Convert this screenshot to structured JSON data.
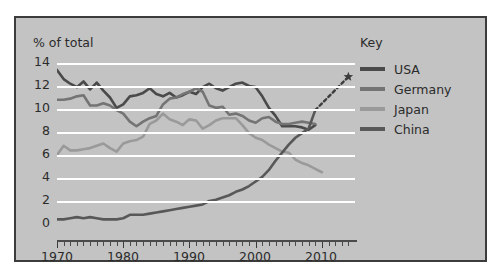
{
  "axis_title": "% of total",
  "legend": {
    "title": "Key",
    "items": [
      {
        "label": "USA",
        "color": "#4a4a4a"
      },
      {
        "label": "Germany",
        "color": "#747474"
      },
      {
        "label": "Japan",
        "color": "#9a9a9a"
      },
      {
        "label": "China",
        "color": "#585858"
      }
    ]
  },
  "yticks": [
    "14",
    "12",
    "10",
    "8",
    "6",
    "4",
    "2",
    "0"
  ],
  "xticks": [
    "1970",
    "1980",
    "1990",
    "2000",
    "2010"
  ],
  "chart_data": {
    "type": "line",
    "title": "",
    "xlabel": "",
    "ylabel": "% of total",
    "xlim": [
      1970,
      2015
    ],
    "ylim": [
      0,
      14
    ],
    "yticks": [
      0,
      2,
      4,
      6,
      8,
      10,
      12,
      14
    ],
    "xticks": [
      1970,
      1980,
      1990,
      2000,
      2010
    ],
    "minor_xtick_interval": 1,
    "grid": "horizontal",
    "legend_position": "right",
    "annotations": [
      {
        "type": "dotted-projection",
        "series": "China",
        "from": [
          2009,
          9.9
        ],
        "to": [
          2014,
          12.8
        ],
        "marker": "star"
      }
    ],
    "series": [
      {
        "name": "USA",
        "color": "#4a4a4a",
        "x": [
          1970,
          1971,
          1972,
          1973,
          1974,
          1975,
          1976,
          1977,
          1978,
          1979,
          1980,
          1981,
          1982,
          1983,
          1984,
          1985,
          1986,
          1987,
          1988,
          1989,
          1990,
          1991,
          1992,
          1993,
          1994,
          1995,
          1996,
          1997,
          1998,
          1999,
          2000,
          2001,
          2002,
          2003,
          2004,
          2005,
          2006,
          2007,
          2008,
          2009
        ],
        "y": [
          13.4,
          12.6,
          12.2,
          11.9,
          12.4,
          11.7,
          12.3,
          11.6,
          11.0,
          10.1,
          10.4,
          11.1,
          11.2,
          11.4,
          11.8,
          11.3,
          11.1,
          11.4,
          11.0,
          11.2,
          11.5,
          11.3,
          11.9,
          12.2,
          11.8,
          11.6,
          11.9,
          12.2,
          12.3,
          12.0,
          11.9,
          11.1,
          10.1,
          9.4,
          8.5,
          8.5,
          8.5,
          8.4,
          8.2,
          8.6
        ]
      },
      {
        "name": "Germany",
        "color": "#747474",
        "x": [
          1970,
          1971,
          1972,
          1973,
          1974,
          1975,
          1976,
          1977,
          1978,
          1979,
          1980,
          1981,
          1982,
          1983,
          1984,
          1985,
          1986,
          1987,
          1988,
          1989,
          1990,
          1991,
          1992,
          1993,
          1994,
          1995,
          1996,
          1997,
          1998,
          1999,
          2000,
          2001,
          2002,
          2003,
          2004,
          2005,
          2006,
          2007,
          2008,
          2009
        ],
        "y": [
          10.8,
          10.8,
          10.9,
          11.1,
          11.2,
          10.3,
          10.3,
          10.5,
          10.3,
          9.9,
          9.6,
          8.9,
          8.5,
          8.9,
          9.2,
          9.4,
          10.4,
          10.9,
          11.0,
          11.3,
          11.5,
          11.8,
          11.5,
          10.3,
          10.1,
          10.2,
          9.5,
          9.6,
          9.4,
          9.0,
          8.8,
          9.2,
          9.3,
          8.9,
          8.7,
          8.7,
          8.8,
          8.9,
          8.8,
          8.7
        ]
      },
      {
        "name": "Japan",
        "color": "#9a9a9a",
        "x": [
          1970,
          1971,
          1972,
          1973,
          1974,
          1975,
          1976,
          1977,
          1978,
          1979,
          1980,
          1981,
          1982,
          1983,
          1984,
          1985,
          1986,
          1987,
          1988,
          1989,
          1990,
          1991,
          1992,
          1993,
          1994,
          1995,
          1996,
          1997,
          1998,
          1999,
          2000,
          2001,
          2002,
          2003,
          2004,
          2005,
          2006,
          2007,
          2008,
          2009,
          2010
        ],
        "y": [
          6.0,
          6.8,
          6.4,
          6.4,
          6.5,
          6.6,
          6.8,
          7.0,
          6.6,
          6.3,
          7.0,
          7.2,
          7.3,
          7.6,
          8.7,
          9.0,
          9.6,
          9.1,
          8.9,
          8.6,
          9.1,
          9.0,
          8.3,
          8.6,
          9.0,
          9.2,
          9.2,
          9.2,
          8.6,
          7.9,
          7.5,
          7.3,
          6.9,
          6.6,
          6.3,
          6.2,
          5.6,
          5.3,
          5.1,
          4.8,
          4.5
        ]
      },
      {
        "name": "China",
        "color": "#585858",
        "x": [
          1970,
          1971,
          1972,
          1973,
          1974,
          1975,
          1976,
          1977,
          1978,
          1979,
          1980,
          1981,
          1982,
          1983,
          1984,
          1985,
          1986,
          1987,
          1988,
          1989,
          1990,
          1991,
          1992,
          1993,
          1994,
          1995,
          1996,
          1997,
          1998,
          1999,
          2000,
          2001,
          2002,
          2003,
          2004,
          2005,
          2006,
          2007,
          2008,
          2009
        ],
        "y": [
          0.4,
          0.4,
          0.5,
          0.6,
          0.5,
          0.6,
          0.5,
          0.4,
          0.4,
          0.4,
          0.5,
          0.8,
          0.8,
          0.8,
          0.9,
          1.0,
          1.1,
          1.2,
          1.3,
          1.4,
          1.5,
          1.6,
          1.7,
          2.0,
          2.1,
          2.3,
          2.5,
          2.8,
          3.0,
          3.3,
          3.7,
          4.1,
          4.7,
          5.5,
          6.2,
          6.9,
          7.5,
          7.9,
          8.3,
          9.9
        ]
      }
    ]
  }
}
